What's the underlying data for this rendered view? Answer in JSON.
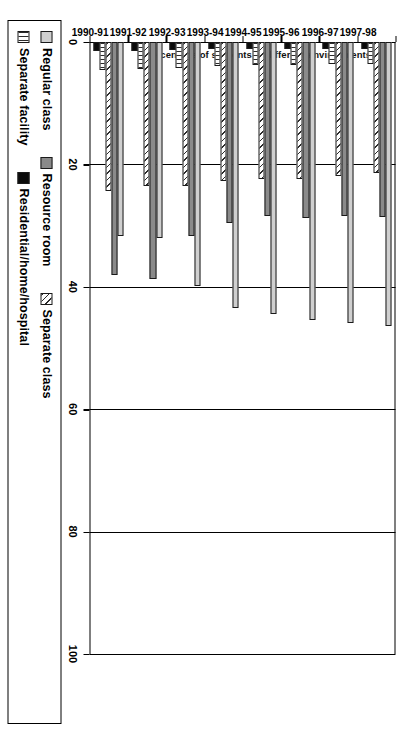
{
  "chart_data": {
    "type": "bar",
    "orientation": "vertical-grouped",
    "title": "",
    "xlabel": "",
    "ylabel": "Percentage of students in different environments",
    "ylim": [
      0,
      100
    ],
    "ytick_labels": [
      "0",
      "20",
      "40",
      "60",
      "80",
      "100"
    ],
    "ytick_values": [
      0,
      20,
      40,
      60,
      80,
      100
    ],
    "grid": true,
    "legend_position": "bottom",
    "categories": [
      "1990-91",
      "1991-92",
      "1992-93",
      "1993-94",
      "1994-95",
      "1995-96",
      "1996-97",
      "1997-98"
    ],
    "series": [
      {
        "name": "Regular class",
        "pattern": "light-grey-dotted",
        "color": "#cfcfcf",
        "values": [
          31.7,
          32.0,
          39.8,
          43.4,
          44.5,
          45.4,
          45.9,
          46.4
        ]
      },
      {
        "name": "Resource room",
        "pattern": "solid-grey",
        "color": "#8a8a8a",
        "values": [
          38.0,
          38.7,
          31.7,
          29.6,
          28.5,
          28.7,
          28.5,
          28.6
        ]
      },
      {
        "name": "Separate class",
        "pattern": "diagonal-hatch",
        "color": "#2b2b2b",
        "values": [
          24.4,
          23.5,
          23.5,
          22.7,
          22.4,
          22.4,
          21.9,
          21.4
        ]
      },
      {
        "name": "Separate facility",
        "pattern": "vertical-lines",
        "color": "#2b2b2b",
        "values": [
          4.5,
          4.4,
          4.3,
          3.9,
          3.8,
          3.7,
          3.6,
          3.6
        ]
      },
      {
        "name": "Residential/home/hospital",
        "pattern": "solid-black",
        "color": "#0b0b0b",
        "values": [
          1.5,
          1.4,
          1.3,
          1.2,
          1.1,
          1.1,
          1.1,
          1.1
        ]
      }
    ]
  },
  "legend": {
    "row1": [
      {
        "label": "Regular class",
        "swatch": "light-grey-dotted"
      },
      {
        "label": "Resource room",
        "swatch": "solid-grey"
      },
      {
        "label": "Separate class",
        "swatch": "diagonal-hatch"
      }
    ],
    "row2": [
      {
        "label": "Separate facility",
        "swatch": "vertical-lines"
      },
      {
        "label": "Residential/home/hospital",
        "swatch": "solid-black"
      }
    ]
  }
}
